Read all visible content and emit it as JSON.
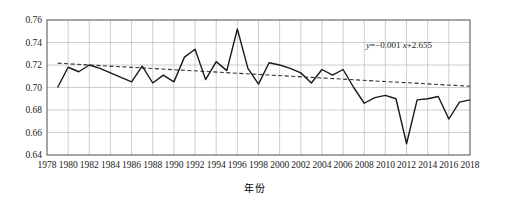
{
  "chart_data": {
    "type": "line",
    "title": "",
    "xlabel": "年份",
    "ylabel": "年平均密集度",
    "xlim": [
      1978,
      2018
    ],
    "ylim": [
      0.64,
      0.76
    ],
    "grid": true,
    "legend": null,
    "x_ticks": [
      1978,
      1980,
      1982,
      1984,
      1986,
      1988,
      1990,
      1992,
      1994,
      1996,
      1998,
      2000,
      2002,
      2004,
      2006,
      2008,
      2010,
      2012,
      2014,
      2016,
      2018
    ],
    "y_ticks": [
      "0.64",
      "0.66",
      "0.68",
      "0.70",
      "0.72",
      "0.74",
      "0.76"
    ],
    "annotation": "y=-0.001 x+2.655",
    "annotation_parts": {
      "y": "y",
      "body": "=−0.001 ",
      "x": "x",
      "tail": "+2.655"
    },
    "series": [
      {
        "name": "年平均密集度",
        "style": "solid",
        "color": "#1a1a1a",
        "x": [
          1979,
          1980,
          1981,
          1982,
          1983,
          1984,
          1985,
          1986,
          1987,
          1988,
          1989,
          1990,
          1991,
          1992,
          1993,
          1994,
          1995,
          1996,
          1997,
          1998,
          1999,
          2000,
          2001,
          2002,
          2003,
          2004,
          2005,
          2006,
          2007,
          2008,
          2009,
          2010,
          2011,
          2012,
          2013,
          2014,
          2015,
          2016,
          2017,
          2018
        ],
        "values": [
          0.7,
          0.718,
          0.714,
          0.72,
          0.717,
          0.713,
          0.709,
          0.705,
          0.719,
          0.704,
          0.711,
          0.705,
          0.727,
          0.734,
          0.707,
          0.723,
          0.715,
          0.752,
          0.717,
          0.703,
          0.722,
          0.72,
          0.717,
          0.713,
          0.704,
          0.716,
          0.711,
          0.716,
          0.7,
          0.686,
          0.691,
          0.693,
          0.69,
          0.65,
          0.689,
          0.69,
          0.692,
          0.672,
          0.687,
          0.689
        ]
      },
      {
        "name": "趋势线",
        "style": "dashed",
        "color": "#333333",
        "x": [
          1979,
          2018
        ],
        "values": [
          0.7216,
          0.7011
        ]
      }
    ]
  },
  "axes": {
    "x_title": "年份",
    "y_title": "年平均密集度"
  }
}
